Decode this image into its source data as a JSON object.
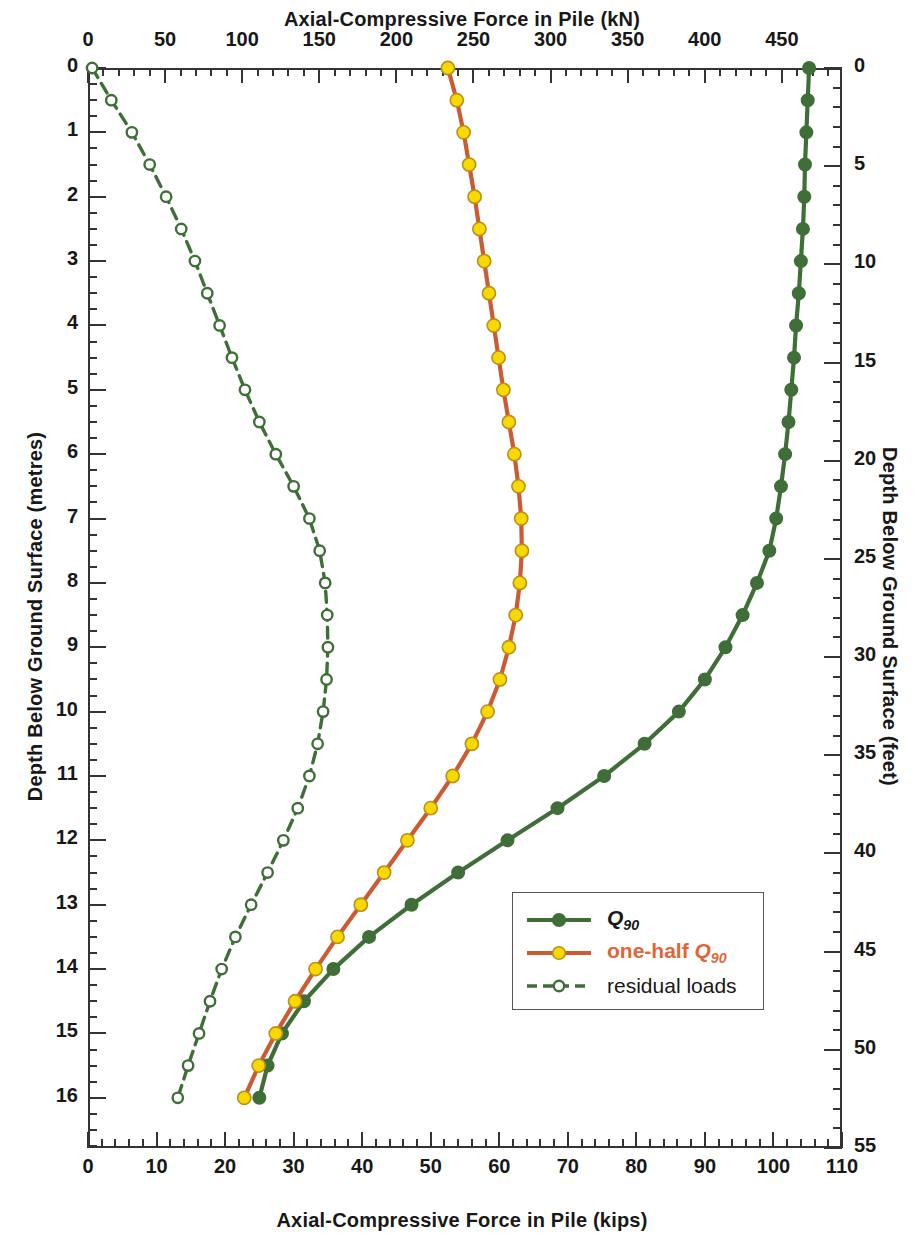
{
  "axes": {
    "top_title": "Axial-Compressive Force in Pile (kN)",
    "bottom_title": "Axial-Compressive Force in Pile (kips)",
    "left_title": "Depth Below Ground Surface (metres)",
    "right_title": "Depth Below Ground Surface (feet)"
  },
  "legend": {
    "items": [
      {
        "label": "Q90",
        "label_main": "Q",
        "label_sub": "90",
        "style": "solid",
        "line_color": "#3f6e38",
        "marker_color": "#3f6e38",
        "marker": "filled",
        "text_color": "#181818"
      },
      {
        "label": "one-half Q90",
        "label_main": "one-half Q",
        "label_sub": "90",
        "style": "solid",
        "line_color": "#cc5a33",
        "marker_color": "#f7d900",
        "marker": "filled",
        "text_color": "#e0663a"
      },
      {
        "label": "residual loads",
        "label_main": "residual loads",
        "label_sub": "",
        "style": "dashed",
        "line_color": "#3f6e38",
        "marker_color": "#ffffff",
        "marker": "open",
        "text_color": "#181818"
      }
    ]
  },
  "chart_data": {
    "type": "line",
    "xlabel": "Axial-Compressive Force in Pile (kips)",
    "xlabel_secondary": "Axial-Compressive Force in Pile (kN)",
    "ylabel": "Depth Below Ground Surface (metres)",
    "ylabel_secondary": "Depth Below Ground Surface (feet)",
    "orientation": "depth-on-y-inverted",
    "grid": false,
    "legend_position": "lower-right-inside",
    "xlim": [
      0,
      110
    ],
    "xlim_secondary_kN": [
      0,
      489
    ],
    "ylim": [
      0,
      16.78
    ],
    "ylim_secondary_ft": [
      0,
      55
    ],
    "xticks": [
      0,
      10,
      20,
      30,
      40,
      50,
      60,
      70,
      80,
      90,
      100,
      110
    ],
    "xticks_top_kN": [
      0,
      50,
      100,
      150,
      200,
      250,
      300,
      350,
      400,
      450
    ],
    "yticks": [
      0,
      1,
      2,
      3,
      4,
      5,
      6,
      7,
      8,
      9,
      10,
      11,
      12,
      13,
      14,
      15,
      16
    ],
    "yticks_right_ft": [
      0,
      5,
      10,
      15,
      20,
      25,
      30,
      35,
      40,
      45,
      50,
      55
    ],
    "xminor_step": 2,
    "yminor_step": 0.25,
    "units_note": "x in kips (bottom) and kN (top); y in metres (left) and feet (right)",
    "series": [
      {
        "name": "Q90",
        "line_color": "#3f6e38",
        "marker_color": "#3f6e38",
        "marker": "filled-circle",
        "style": "solid",
        "depth_m": [
          0,
          0.5,
          1,
          1.5,
          2,
          2.5,
          3,
          3.5,
          4,
          4.5,
          5,
          5.5,
          6,
          6.5,
          7,
          7.5,
          8,
          8.5,
          9,
          9.5,
          10,
          10.5,
          11,
          11.5,
          12,
          12.5,
          13,
          13.5,
          14,
          14.5,
          15,
          15.5,
          16
        ],
        "force_kips": [
          105.2,
          105.0,
          104.8,
          104.6,
          104.5,
          104.3,
          104.0,
          103.7,
          103.3,
          103.0,
          102.6,
          102.2,
          101.7,
          101.1,
          100.4,
          99.4,
          97.6,
          95.5,
          93.0,
          90.0,
          86.2,
          81.2,
          75.3,
          68.5,
          61.2,
          54.0,
          47.2,
          41.0,
          35.8,
          31.5,
          28.3,
          26.2,
          25.0
        ]
      },
      {
        "name": "one-half Q90",
        "line_color": "#cc5a33",
        "marker_color": "#f7d900",
        "marker": "filled-circle",
        "style": "solid",
        "depth_m": [
          0,
          0.5,
          1,
          1.5,
          2,
          2.5,
          3,
          3.5,
          4,
          4.5,
          5,
          5.5,
          6,
          6.5,
          7,
          7.5,
          8,
          8.5,
          9,
          9.5,
          10,
          10.5,
          11,
          11.5,
          12,
          12.5,
          13,
          13.5,
          14,
          14.5,
          15,
          15.5,
          16
        ],
        "force_kips": [
          52.5,
          53.8,
          54.8,
          55.6,
          56.4,
          57.1,
          57.8,
          58.5,
          59.2,
          59.9,
          60.6,
          61.4,
          62.2,
          62.8,
          63.2,
          63.3,
          63.0,
          62.4,
          61.4,
          60.1,
          58.3,
          56.0,
          53.2,
          50.0,
          46.6,
          43.2,
          39.8,
          36.4,
          33.2,
          30.2,
          27.4,
          24.9,
          22.8
        ]
      },
      {
        "name": "residual loads",
        "line_color": "#3f6e38",
        "marker_color": "#ffffff",
        "marker": "open-circle",
        "style": "dashed",
        "depth_m": [
          0,
          0.5,
          1,
          1.5,
          2,
          2.5,
          3,
          3.5,
          4,
          4.5,
          5,
          5.5,
          6,
          6.5,
          7,
          7.5,
          8,
          8.5,
          9,
          9.5,
          10,
          10.5,
          11,
          11.5,
          12,
          12.5,
          13,
          13.5,
          14,
          14.5,
          15,
          15.5,
          16
        ],
        "force_kips": [
          0.6,
          3.4,
          6.4,
          9.0,
          11.4,
          13.6,
          15.6,
          17.4,
          19.2,
          21.0,
          22.9,
          25.0,
          27.4,
          30.0,
          32.3,
          33.8,
          34.6,
          34.9,
          35.0,
          34.8,
          34.3,
          33.5,
          32.3,
          30.6,
          28.5,
          26.2,
          23.8,
          21.5,
          19.5,
          17.8,
          16.2,
          14.6,
          13.1
        ]
      }
    ]
  }
}
